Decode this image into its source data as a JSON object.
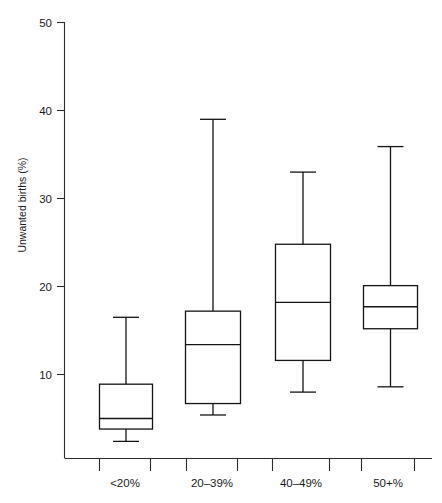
{
  "chart_data": {
    "type": "box",
    "title": "",
    "subtitle": "",
    "xlabel": "",
    "ylabel": "Unwanted births (%)",
    "categories": [
      "<20%",
      "20–39%",
      "40–49%",
      "50+%"
    ],
    "ylim": [
      0,
      50
    ],
    "yticks": [
      10,
      20,
      30,
      40,
      50
    ],
    "ytick_labels": [
      "10",
      "20",
      "30",
      "40",
      "50"
    ],
    "grid": false,
    "legend": false,
    "boxes": [
      {
        "category": "<20%",
        "min": 2.4,
        "q1": 3.8,
        "median": 5.0,
        "q3": 8.9,
        "max": 16.5
      },
      {
        "category": "20–39%",
        "min": 5.4,
        "q1": 6.7,
        "median": 13.4,
        "q3": 17.2,
        "max": 39.0
      },
      {
        "category": "40–49%",
        "min": 8.0,
        "q1": 11.6,
        "median": 18.2,
        "q3": 24.8,
        "max": 33.0
      },
      {
        "category": "50+%",
        "min": 8.6,
        "q1": 15.2,
        "median": 17.7,
        "q3": 20.1,
        "max": 35.9
      }
    ]
  },
  "axes": {
    "y_axis_label": "Unwanted births (%)",
    "y_tick_50": "50",
    "y_tick_40": "40",
    "y_tick_30": "30",
    "y_tick_20": "20",
    "y_tick_10": "10",
    "x_tick_1": "<20%",
    "x_tick_2": "20–39%",
    "x_tick_3": "40–49%",
    "x_tick_4": "50+%"
  },
  "colors": {
    "axis": "#2a2a2a",
    "box_stroke": "#141414",
    "box_fill": "#ffffff",
    "background": "#ffffff"
  }
}
